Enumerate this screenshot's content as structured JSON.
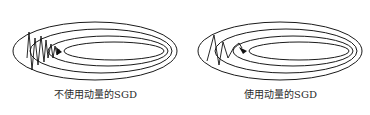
{
  "diagram": {
    "panels": [
      {
        "caption": "不使用动量的SGD",
        "description": "Optimization path oscillates strongly across contour ellipses"
      },
      {
        "caption": "使用动量的SGD",
        "description": "Optimization path damps oscillation and moves toward minimum"
      }
    ],
    "colors": {
      "contour": "#1a1a1a",
      "path": "#111111",
      "caption": "#2a2a2a",
      "background": "#ffffff"
    }
  }
}
